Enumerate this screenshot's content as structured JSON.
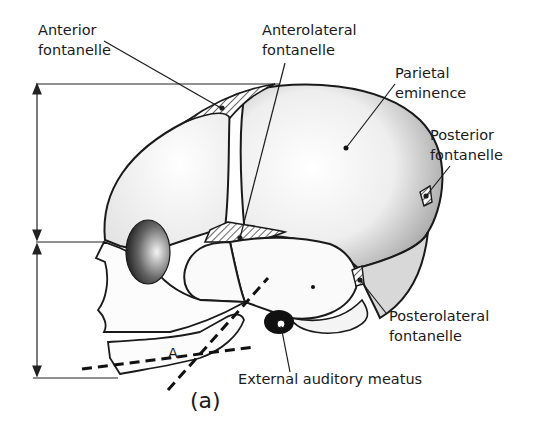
{
  "figure": {
    "caption": "(a)",
    "labels": {
      "anterior_fontanelle": [
        "Anterior",
        "fontanelle"
      ],
      "anterolateral_fontanelle": [
        "Anterolateral",
        "fontanelle"
      ],
      "parietal_eminence": [
        "Parietal",
        "eminence"
      ],
      "posterior_fontanelle": [
        "Posterior",
        "fontanelle"
      ],
      "posterolateral_fontanelle": [
        "Posterolateral",
        "fontanelle"
      ],
      "external_auditory_meatus": "External  auditory meatus",
      "angle_marker": "A"
    },
    "colors": {
      "ink": "#1a1a1a",
      "paper": "#ffffff"
    }
  }
}
